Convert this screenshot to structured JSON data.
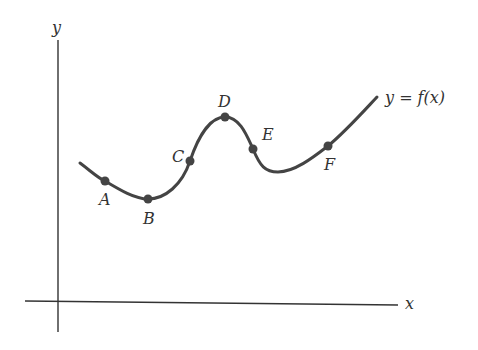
{
  "diagram": {
    "axes": {
      "x_label": "x",
      "y_label": "y"
    },
    "curve_label": "y = f(x)",
    "points": [
      {
        "name": "A",
        "x": 105,
        "y": 181,
        "label_x": 99,
        "label_y": 205
      },
      {
        "name": "B",
        "x": 148,
        "y": 199,
        "label_x": 143,
        "label_y": 224
      },
      {
        "name": "C",
        "x": 190,
        "y": 161,
        "label_x": 172,
        "label_y": 162
      },
      {
        "name": "D",
        "x": 225,
        "y": 117,
        "label_x": 218,
        "label_y": 107
      },
      {
        "name": "E",
        "x": 253,
        "y": 149,
        "label_x": 262,
        "label_y": 140
      },
      {
        "name": "F",
        "x": 328,
        "y": 146,
        "label_x": 324,
        "label_y": 170
      }
    ],
    "colors": {
      "curve": "#444444",
      "axis": "#333333",
      "text": "#333333"
    }
  }
}
